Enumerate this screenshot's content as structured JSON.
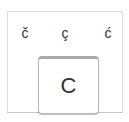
{
  "popup": {
    "variants": [
      {
        "char": "č"
      },
      {
        "char": "ç"
      },
      {
        "char": "ć"
      }
    ],
    "key": {
      "char": "C"
    }
  },
  "colors": {
    "border": "#dcdcdc",
    "text": "#333333",
    "background": "#ffffff"
  }
}
